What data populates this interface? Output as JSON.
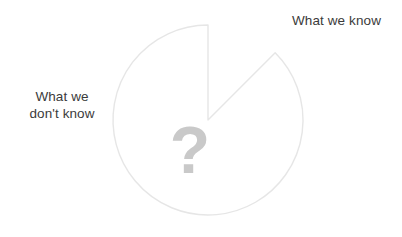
{
  "chart_data": {
    "type": "pie",
    "title": "",
    "subtitle": "",
    "xlabel": "",
    "ylabel": "",
    "legend_position": "none",
    "grid": false,
    "start_angle_deg": 90,
    "direction": "clockwise",
    "categories": [
      "What we know",
      "What we don't know"
    ],
    "values": [
      12.5,
      87.5
    ],
    "labels": [
      "What we know",
      "What we don't know"
    ],
    "annotations": [
      "?"
    ],
    "colors": [
      "#3a3a3a",
      "#ffffff"
    ],
    "slice_outline_color": "#e6e6e6",
    "exploded_slice": "What we know",
    "slices": [
      {
        "name": "What we know",
        "value": 12.5,
        "color": "#3a3a3a",
        "start_deg": 0,
        "end_deg": 45,
        "exploded": true,
        "label": "What we know"
      },
      {
        "name": "What we don't know",
        "value": 87.5,
        "color": "#ffffff",
        "start_deg": 45,
        "end_deg": 360,
        "exploded": false,
        "label": "What we don't know"
      }
    ]
  },
  "figure": {
    "background": "#ffffff",
    "center": {
      "x": 208,
      "y": 120
    },
    "radius": 95
  },
  "labels": {
    "know": "What we know",
    "dont_know_line1": "What we",
    "dont_know_line2": "don't know",
    "question_mark": "?"
  },
  "colors": {
    "known_slice": "#3a3a3a",
    "unknown_slice": "#ffffff",
    "outline": "#e6e6e6",
    "text": "#3b3b3b",
    "question_mark": "#c9c9c9",
    "background": "#ffffff"
  }
}
